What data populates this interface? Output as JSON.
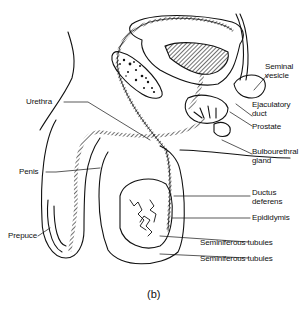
{
  "figure": {
    "caption": "(b)"
  },
  "labels": {
    "seminal_vesicle": "Seminal\nvesicle",
    "ejaculatory_duct": "Ejaculatory\nduct",
    "prostate": "Prostate",
    "bulbourethral_gland": "Bulbourethral\ngland",
    "urethra": "Urethra",
    "penis": "Penis",
    "ductus_deferens": "Ductus\ndeferens",
    "epididymis": "Epididymis",
    "prepuce": "Prepuce",
    "seminiferous_tubules_1": "Seminiferous tubules",
    "seminiferous_tubules_2": "Seminiferous tubules"
  },
  "colors": {
    "ink": "#111111",
    "background": "#ffffff"
  }
}
